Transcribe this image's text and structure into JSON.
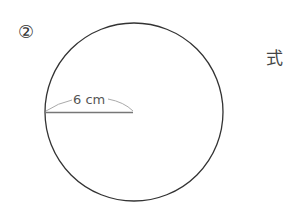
{
  "problem": {
    "number_label": "②",
    "formula_label": "式"
  },
  "figure": {
    "shape": "circle",
    "radius_label": "6 cm",
    "radius_value": 6,
    "radius_unit": "cm",
    "colors": {
      "outline": "#333333",
      "radius_line": "#777777",
      "arc": "#aaaaaa"
    }
  }
}
